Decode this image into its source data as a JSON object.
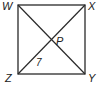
{
  "diagram": {
    "shape": "square",
    "vertices": {
      "W": {
        "label": "W",
        "x": 18,
        "y": 5
      },
      "X": {
        "label": "X",
        "x": 85,
        "y": 5
      },
      "Y": {
        "label": "Y",
        "x": 85,
        "y": 74
      },
      "Z": {
        "label": "Z",
        "x": 18,
        "y": 74
      }
    },
    "intersection": {
      "label": "P"
    },
    "segment_labels": [
      {
        "segment": "ZP",
        "value": "7"
      }
    ],
    "stroke_color": "#2a2a2a"
  }
}
